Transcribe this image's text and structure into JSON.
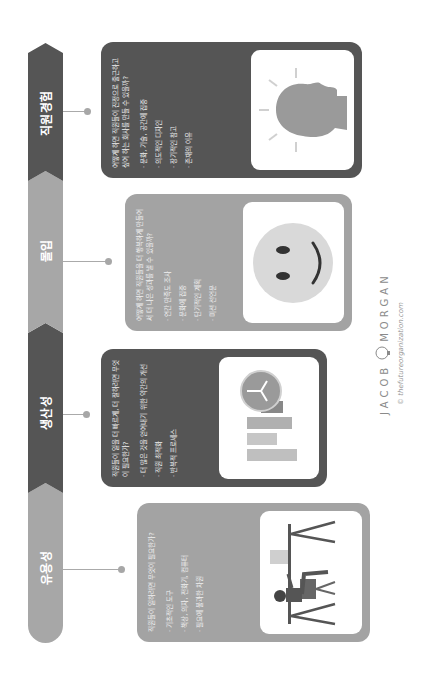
{
  "timeline": {
    "stages": [
      {
        "id": "utility",
        "label": "유용성",
        "shade": "light"
      },
      {
        "id": "productivity",
        "label": "생산성",
        "shade": "dark"
      },
      {
        "id": "engagement",
        "label": "몰입",
        "shade": "light"
      },
      {
        "id": "employee_experience",
        "label": "직원경험",
        "shade": "dark"
      }
    ]
  },
  "cards": [
    {
      "stage": "유용성",
      "question": "직원들이 일하려면 무엇이 필요한가?",
      "bullets": [
        "기초적인 도구",
        "책상, 의자, 전화기, 컴퓨터",
        "필요에 불과한 차원"
      ],
      "image": "person-at-desk-illustration"
    },
    {
      "stage": "생산성",
      "question": "직원들이 일을 더 빠르게, 더 잘하려면 무엇이 필요한가?",
      "bullets": [
        "더 많은 것을 얻어내기 위한 약간의 개선",
        "직원 최적화",
        "반복적 프로세스"
      ],
      "image": "bar-chart-clock-icon"
    },
    {
      "stage": "몰입",
      "question": "어떻게 하면 직원들을 더 행복하게 만들어서 더 나은 성과를 낼 수 있을까?",
      "bullets": [
        "연간 만족도 조사",
        "문화에 집중",
        "단기적인 계획",
        "미션 선언문"
      ],
      "image": "smiley-face-icon"
    },
    {
      "stage": "직원경험",
      "question": "어떻게 하면 직원들이 진정으로 출근하고 싶어 하는 회사를 만들 수 있을까?",
      "bullets": [
        "문화, 기술, 공간에 집중",
        "의도적인 디자인",
        "장기적인 참고",
        "존재의 이유"
      ],
      "image": "head-lightbulb-icon"
    }
  ],
  "branding": {
    "name_left": "JACOB",
    "name_right": "MORGAN",
    "url": "© thefutureorganization.com"
  },
  "colors": {
    "light_gray": "#a7a7a7",
    "dark_gray": "#555555",
    "white": "#ffffff"
  }
}
